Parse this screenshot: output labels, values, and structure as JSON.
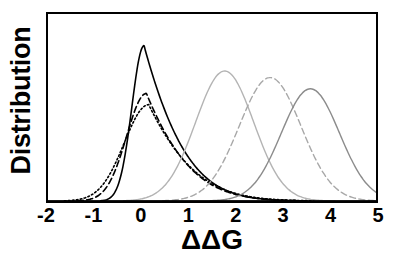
{
  "chart_data": {
    "type": "line",
    "title": "",
    "xlabel": "ΔΔG",
    "ylabel": "Distribution",
    "xlim": [
      -2,
      5
    ],
    "ylim": [
      0,
      1
    ],
    "xticks": [
      -2,
      -1,
      0,
      1,
      2,
      3,
      4,
      5
    ],
    "xticklabels": [
      "-2",
      "-1",
      "0",
      "1",
      "2",
      "3",
      "4",
      "5"
    ],
    "yticks": [],
    "yticklabels": [],
    "grid": false,
    "legend": "none",
    "series": [
      {
        "name": "black-solid-sharp-peak",
        "color": "#000000",
        "linestyle": "solid",
        "linewidth": 1.6,
        "shape": "skewed-peak",
        "peak_x": 0.05,
        "peak_y": 0.83,
        "left_width": 0.26,
        "right_width": 0.95,
        "x": [
          -2.0,
          -1.5,
          -1.2,
          -1.0,
          -0.8,
          -0.6,
          -0.5,
          -0.4,
          -0.3,
          -0.2,
          -0.1,
          0.0,
          0.05,
          0.1,
          0.2,
          0.3,
          0.4,
          0.5,
          0.6,
          0.8,
          1.0,
          1.2,
          1.5,
          1.8,
          2.1,
          2.4,
          2.8,
          3.2,
          3.6,
          4.0,
          4.5,
          5.0
        ],
        "y": [
          0.0,
          0.0,
          0.0,
          0.005,
          0.01,
          0.02,
          0.035,
          0.07,
          0.17,
          0.38,
          0.66,
          0.81,
          0.83,
          0.81,
          0.7,
          0.59,
          0.5,
          0.43,
          0.37,
          0.28,
          0.21,
          0.16,
          0.105,
          0.068,
          0.044,
          0.028,
          0.015,
          0.008,
          0.004,
          0.002,
          0.001,
          0.0
        ]
      },
      {
        "name": "black-dashed",
        "color": "#000000",
        "linestyle": "dashed",
        "linewidth": 1.6,
        "shape": "skewed-peak",
        "peak_x": 0.1,
        "peak_y": 0.575,
        "left_width": 0.42,
        "right_width": 1.0,
        "x": [
          -2.0,
          -1.6,
          -1.3,
          -1.1,
          -0.9,
          -0.75,
          -0.6,
          -0.5,
          -0.4,
          -0.3,
          -0.2,
          -0.1,
          0.0,
          0.1,
          0.2,
          0.3,
          0.45,
          0.6,
          0.8,
          1.0,
          1.3,
          1.6,
          2.0,
          2.4,
          2.8,
          3.3,
          3.8,
          4.3,
          5.0
        ],
        "y": [
          0.0,
          0.0,
          0.005,
          0.012,
          0.028,
          0.05,
          0.09,
          0.145,
          0.23,
          0.33,
          0.44,
          0.53,
          0.565,
          0.575,
          0.565,
          0.54,
          0.48,
          0.41,
          0.325,
          0.25,
          0.165,
          0.11,
          0.062,
          0.035,
          0.018,
          0.008,
          0.004,
          0.002,
          0.0
        ]
      },
      {
        "name": "black-dotted",
        "color": "#000000",
        "linestyle": "dotted",
        "linewidth": 1.6,
        "shape": "skewed-peak",
        "peak_x": 0.15,
        "peak_y": 0.515,
        "left_width": 0.52,
        "right_width": 1.05,
        "x": [
          -2.0,
          -1.7,
          -1.4,
          -1.2,
          -1.0,
          -0.85,
          -0.7,
          -0.55,
          -0.45,
          -0.35,
          -0.25,
          -0.1,
          0.0,
          0.15,
          0.3,
          0.45,
          0.6,
          0.8,
          1.0,
          1.3,
          1.6,
          2.0,
          2.4,
          2.9,
          3.4,
          4.0,
          4.6,
          5.0
        ],
        "y": [
          0.0,
          0.002,
          0.01,
          0.022,
          0.045,
          0.072,
          0.11,
          0.165,
          0.215,
          0.275,
          0.345,
          0.44,
          0.48,
          0.515,
          0.5,
          0.47,
          0.425,
          0.355,
          0.285,
          0.2,
          0.138,
          0.082,
          0.048,
          0.024,
          0.011,
          0.005,
          0.002,
          0.0
        ]
      },
      {
        "name": "gray-solid-bell-1",
        "color": "#b4b4b4",
        "linestyle": "solid",
        "linewidth": 1.4,
        "shape": "gaussian",
        "peak_x": 1.77,
        "peak_y": 0.695,
        "sigma": 0.62,
        "x": [
          -0.6,
          -0.2,
          0.2,
          0.5,
          0.8,
          1.0,
          1.2,
          1.4,
          1.6,
          1.77,
          1.95,
          2.15,
          2.35,
          2.55,
          2.8,
          3.05,
          3.3,
          3.6,
          3.9,
          4.3,
          4.7,
          5.0
        ],
        "y": [
          0.002,
          0.01,
          0.035,
          0.075,
          0.155,
          0.235,
          0.345,
          0.475,
          0.6,
          0.695,
          0.665,
          0.565,
          0.435,
          0.305,
          0.175,
          0.09,
          0.042,
          0.015,
          0.005,
          0.001,
          0.0,
          0.0
        ]
      },
      {
        "name": "gray-dashed-bell-2",
        "color": "#a8a8a8",
        "linestyle": "dashed",
        "linewidth": 1.4,
        "shape": "gaussian",
        "peak_x": 2.74,
        "peak_y": 0.66,
        "sigma": 0.66,
        "x": [
          0.2,
          0.6,
          1.0,
          1.3,
          1.6,
          1.85,
          2.1,
          2.3,
          2.5,
          2.74,
          2.95,
          3.15,
          3.4,
          3.6,
          3.85,
          4.1,
          4.4,
          4.7,
          5.0
        ],
        "y": [
          0.002,
          0.01,
          0.04,
          0.085,
          0.165,
          0.255,
          0.38,
          0.49,
          0.585,
          0.66,
          0.635,
          0.56,
          0.43,
          0.325,
          0.2,
          0.115,
          0.05,
          0.02,
          0.008
        ]
      },
      {
        "name": "gray-solid-bell-3",
        "color": "#8c8c8c",
        "linestyle": "solid",
        "linewidth": 1.4,
        "shape": "gaussian",
        "peak_x": 3.6,
        "peak_y": 0.6,
        "sigma": 0.62,
        "x": [
          1.0,
          1.5,
          1.9,
          2.2,
          2.5,
          2.75,
          2.95,
          3.15,
          3.4,
          3.6,
          3.8,
          4.0,
          4.2,
          4.45,
          4.7,
          4.9,
          5.0
        ],
        "y": [
          0.004,
          0.012,
          0.03,
          0.06,
          0.115,
          0.19,
          0.27,
          0.36,
          0.495,
          0.6,
          0.575,
          0.5,
          0.4,
          0.265,
          0.145,
          0.075,
          0.05
        ]
      }
    ]
  }
}
